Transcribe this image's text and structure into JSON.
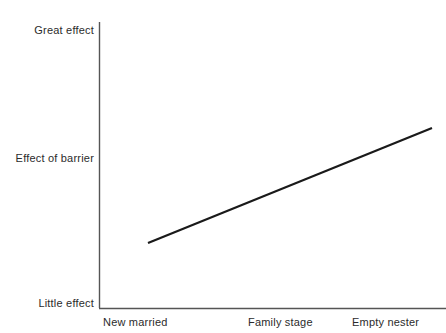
{
  "chart_data": {
    "type": "line",
    "title": "",
    "xlabel": "Family stage",
    "ylabel": "Effect of barrier",
    "categories": [
      "New married",
      "Empty nester"
    ],
    "x": [
      "New married",
      "Empty nester"
    ],
    "series": [
      {
        "name": "Effect of barrier",
        "values": [
          0.23,
          0.63
        ]
      }
    ],
    "y_tick_labels": [
      "Little effect",
      "Effect of barrier",
      "Great effect"
    ],
    "x_tick_labels": [
      "New married",
      "Empty nester"
    ],
    "ylim": [
      0,
      1
    ],
    "grid": false,
    "legend": "none",
    "line_color": "#1a1a1a",
    "axis_color": "#555555",
    "background_color": "#ffffff",
    "annotation": "A single straight rising trend line showing the effect of barrier increases from New married to Empty nester.",
    "geometry": {
      "axis_x": 99,
      "axis_top_y": 22,
      "axis_bottom_y": 308,
      "axis_right_x": 446,
      "line_start": [
        148,
        243
      ],
      "line_end": [
        432,
        128
      ]
    }
  },
  "axes": {
    "y": {
      "top_label": "Great effect",
      "middle_label": "Effect of barrier",
      "bottom_label": "Little effect"
    },
    "x": {
      "left_label": "New married",
      "center_label": "Family stage",
      "right_label": "Empty nester"
    }
  },
  "colors": {
    "line": "#1a1a1a",
    "axis": "#555555",
    "text": "#2b2b2b",
    "background": "#ffffff"
  }
}
